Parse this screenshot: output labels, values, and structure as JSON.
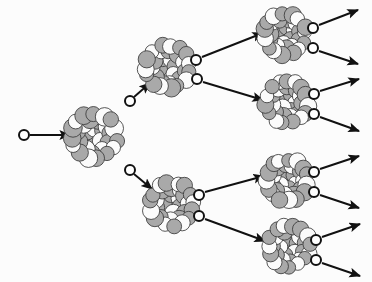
{
  "figure": {
    "background_color": "#fcfcfc",
    "stroke_color": "#1a1a1a",
    "nucleon_gray": "#a9a9a9",
    "nucleon_white": "#fbfbfb",
    "neutron_fill": "#ffffff",
    "neutron_stroke": "#111111",
    "arrow_color": "#111111"
  },
  "nuclei": [
    {
      "id": "nucleus-gen1",
      "label": "generation-1-nucleus",
      "cx": 94,
      "cy": 136,
      "r": 25,
      "generation": 1
    },
    {
      "id": "nucleus-gen2-top",
      "label": "generation-2-nucleus-top",
      "cx": 168,
      "cy": 67,
      "r": 24,
      "generation": 2
    },
    {
      "id": "nucleus-gen2-bottom",
      "label": "generation-2-nucleus-bottom",
      "cx": 172,
      "cy": 204,
      "r": 24,
      "generation": 2
    },
    {
      "id": "nucleus-gen3-a",
      "label": "generation-3-nucleus-1",
      "cx": 285,
      "cy": 34,
      "r": 23,
      "generation": 3
    },
    {
      "id": "nucleus-gen3-b",
      "label": "generation-3-nucleus-2",
      "cx": 287,
      "cy": 102,
      "r": 23,
      "generation": 3
    },
    {
      "id": "nucleus-gen3-c",
      "label": "generation-3-nucleus-3",
      "cx": 287,
      "cy": 180,
      "r": 23,
      "generation": 3
    },
    {
      "id": "nucleus-gen3-d",
      "label": "generation-3-nucleus-4",
      "cx": 289,
      "cy": 246,
      "r": 23,
      "generation": 3
    }
  ],
  "neutrons": [
    {
      "id": "neutron-incident",
      "label": "incident-neutron",
      "cx": 24,
      "cy": 135,
      "r": 5
    },
    {
      "id": "neutron-gen1-up",
      "label": "emitted-neutron-gen1-upper",
      "cx": 130,
      "cy": 101,
      "r": 5
    },
    {
      "id": "neutron-gen1-down",
      "label": "emitted-neutron-gen1-lower",
      "cx": 130,
      "cy": 170,
      "r": 5
    },
    {
      "id": "neutron-gen2t-up",
      "label": "emitted-neutron-gen2top-upper",
      "cx": 196,
      "cy": 60,
      "r": 5
    },
    {
      "id": "neutron-gen2t-down",
      "label": "emitted-neutron-gen2top-lower",
      "cx": 197,
      "cy": 79,
      "r": 5
    },
    {
      "id": "neutron-gen2b-up",
      "label": "emitted-neutron-gen2bottom-upper",
      "cx": 199,
      "cy": 195,
      "r": 5
    },
    {
      "id": "neutron-gen2b-down",
      "label": "emitted-neutron-gen2bottom-lower",
      "cx": 199,
      "cy": 216,
      "r": 5
    },
    {
      "id": "neutron-gen3a-up",
      "label": "emitted-neutron-gen3a-upper",
      "cx": 313,
      "cy": 28,
      "r": 5
    },
    {
      "id": "neutron-gen3a-down",
      "label": "emitted-neutron-gen3a-lower",
      "cx": 313,
      "cy": 48,
      "r": 5
    },
    {
      "id": "neutron-gen3b-up",
      "label": "emitted-neutron-gen3b-upper",
      "cx": 314,
      "cy": 94,
      "r": 5
    },
    {
      "id": "neutron-gen3b-down",
      "label": "emitted-neutron-gen3b-lower",
      "cx": 314,
      "cy": 114,
      "r": 5
    },
    {
      "id": "neutron-gen3c-up",
      "label": "emitted-neutron-gen3c-upper",
      "cx": 314,
      "cy": 172,
      "r": 5
    },
    {
      "id": "neutron-gen3c-down",
      "label": "emitted-neutron-gen3c-lower",
      "cx": 314,
      "cy": 192,
      "r": 5
    },
    {
      "id": "neutron-gen3d-up",
      "label": "emitted-neutron-gen3d-upper",
      "cx": 316,
      "cy": 240,
      "r": 5
    },
    {
      "id": "neutron-gen3d-down",
      "label": "emitted-neutron-gen3d-lower",
      "cx": 316,
      "cy": 260,
      "r": 5
    }
  ],
  "arrows": [
    {
      "id": "arrow-incident",
      "label": "incident-neutron-arrow",
      "x1": 30,
      "y1": 135,
      "x2": 70,
      "y2": 135
    },
    {
      "id": "arrow-gen1-up",
      "label": "neutron-path-to-gen2-top",
      "x1": 134,
      "y1": 97,
      "x2": 150,
      "y2": 83
    },
    {
      "id": "arrow-gen1-down",
      "label": "neutron-path-to-gen2-bottom",
      "x1": 134,
      "y1": 174,
      "x2": 152,
      "y2": 189
    },
    {
      "id": "arrow-gen2t-up",
      "label": "neutron-path-to-gen3-a",
      "x1": 202,
      "y1": 57,
      "x2": 263,
      "y2": 33
    },
    {
      "id": "arrow-gen2t-down",
      "label": "neutron-path-to-gen3-b",
      "x1": 203,
      "y1": 82,
      "x2": 263,
      "y2": 100
    },
    {
      "id": "arrow-gen2b-up",
      "label": "neutron-path-to-gen3-c",
      "x1": 205,
      "y1": 192,
      "x2": 264,
      "y2": 176
    },
    {
      "id": "arrow-gen2b-down",
      "label": "neutron-path-to-gen3-d",
      "x1": 205,
      "y1": 219,
      "x2": 265,
      "y2": 241
    },
    {
      "id": "arrow-gen3a-up",
      "label": "escaping-neutron-arrow-1",
      "x1": 319,
      "y1": 25,
      "x2": 358,
      "y2": 10
    },
    {
      "id": "arrow-gen3a-down",
      "label": "escaping-neutron-arrow-2",
      "x1": 319,
      "y1": 51,
      "x2": 358,
      "y2": 64
    },
    {
      "id": "arrow-gen3b-up",
      "label": "escaping-neutron-arrow-3",
      "x1": 320,
      "y1": 91,
      "x2": 359,
      "y2": 79
    },
    {
      "id": "arrow-gen3b-down",
      "label": "escaping-neutron-arrow-4",
      "x1": 320,
      "y1": 117,
      "x2": 359,
      "y2": 131
    },
    {
      "id": "arrow-gen3c-up",
      "label": "escaping-neutron-arrow-5",
      "x1": 320,
      "y1": 169,
      "x2": 359,
      "y2": 156
    },
    {
      "id": "arrow-gen3c-down",
      "label": "escaping-neutron-arrow-6",
      "x1": 320,
      "y1": 195,
      "x2": 359,
      "y2": 208
    },
    {
      "id": "arrow-gen3d-up",
      "label": "escaping-neutron-arrow-7",
      "x1": 322,
      "y1": 237,
      "x2": 360,
      "y2": 224
    },
    {
      "id": "arrow-gen3d-down",
      "label": "escaping-neutron-arrow-8",
      "x1": 322,
      "y1": 263,
      "x2": 360,
      "y2": 276
    }
  ],
  "nucleon_layout": {
    "rings": [
      {
        "count": 1,
        "radius_frac": 0.0
      },
      {
        "count": 6,
        "radius_frac": 0.36
      },
      {
        "count": 11,
        "radius_frac": 0.66
      },
      {
        "count": 15,
        "radius_frac": 0.9
      }
    ],
    "nucleon_radius_frac": 0.165,
    "gray_pattern": [
      1,
      0,
      1,
      1,
      0,
      1,
      0,
      1,
      0,
      1,
      1,
      0,
      1,
      0,
      1,
      1,
      0,
      1,
      0,
      1,
      0,
      1,
      1,
      0,
      1,
      0,
      1,
      1,
      0,
      1,
      1,
      0,
      1
    ]
  }
}
